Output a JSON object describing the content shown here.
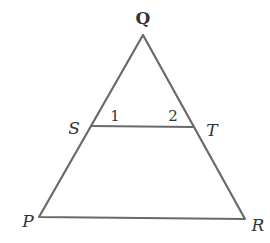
{
  "diagram": {
    "type": "triangle-with-parallel-segment",
    "points": {
      "Q": {
        "label": "Q",
        "x": 143,
        "y": 35
      },
      "S": {
        "label": "S",
        "x": 91,
        "y": 126
      },
      "T": {
        "label": "T",
        "x": 193,
        "y": 127
      },
      "P": {
        "label": "P",
        "x": 39,
        "y": 217
      },
      "R": {
        "label": "R",
        "x": 245,
        "y": 219
      }
    },
    "angles": {
      "angle1": {
        "label": "1"
      },
      "angle2": {
        "label": "2"
      }
    },
    "segments": [
      "QP",
      "QR",
      "PR",
      "ST"
    ],
    "line_color": "#6a6a6a"
  }
}
